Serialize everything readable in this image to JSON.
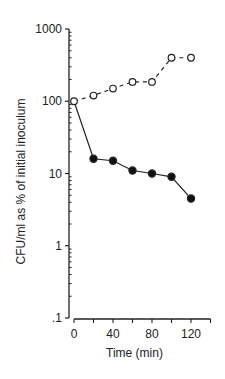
{
  "chart_data": {
    "type": "line",
    "title": "",
    "xlabel": "Time (min)",
    "ylabel": "CFU/ml as % of initial inoculum",
    "yscale": "log",
    "ylim": [
      0.1,
      1000
    ],
    "xlim": [
      0,
      140
    ],
    "x_ticks": [
      0,
      20,
      40,
      60,
      80,
      100,
      120,
      140
    ],
    "x_tick_labels": [
      "0",
      "40",
      "80",
      "120"
    ],
    "y_tick_labels": [
      ".1",
      "1",
      "10",
      "100",
      "1000"
    ],
    "grid": false,
    "legend": null,
    "x": [
      0,
      20,
      40,
      60,
      80,
      100,
      120
    ],
    "series": [
      {
        "name": "open circles (dashed)",
        "marker": "open-circle",
        "line": "dashed",
        "values": [
          100,
          120,
          150,
          185,
          185,
          400,
          400
        ]
      },
      {
        "name": "filled circles (solid)",
        "marker": "filled-circle",
        "line": "solid",
        "values": [
          100,
          16,
          15,
          11,
          10,
          9,
          4.5
        ]
      }
    ]
  }
}
